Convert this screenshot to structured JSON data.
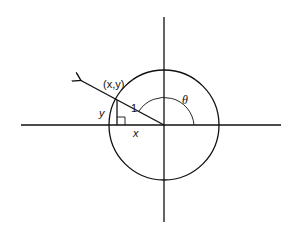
{
  "diagram": {
    "type": "unit-circle",
    "colors": {
      "stroke": "#111111",
      "background": "#ffffff"
    },
    "labels": {
      "point": "(x,y)",
      "radius": "1",
      "vertical_leg": "y",
      "horizontal_leg": "x",
      "angle": "θ"
    },
    "elements": [
      "horizontal-axis",
      "vertical-axis",
      "unit-circle",
      "radius-ray-with-arrow",
      "vertical-leg",
      "right-angle-marker",
      "angle-arc"
    ]
  }
}
